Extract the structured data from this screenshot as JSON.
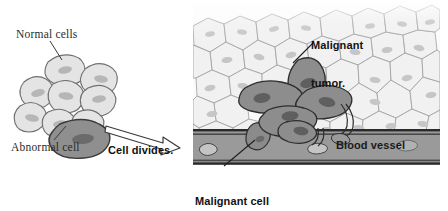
{
  "diagram": {
    "labels": {
      "normal_cells": "Normal cells",
      "abnormal_cell": "Abnormal cell",
      "cell_divides": "Cell divides.",
      "malignant_tumor_line1": "Malignant",
      "malignant_tumor_line2": "tumor.",
      "blood_vessel": "Blood vessel",
      "invades_line1": "Malignant cell",
      "invades_line2": "invades blood."
    },
    "colors": {
      "background": "#ffffff",
      "normal_cell_fill": "#e3e3e3",
      "normal_cell_stroke": "#6e6e6e",
      "normal_nucleus": "#b4b4b4",
      "abnormal_cell_fill": "#8e8e8e",
      "abnormal_cell_stroke": "#3a3a3a",
      "abnormal_nucleus": "#6a6a6a",
      "tissue_fill": "#f2f2f2",
      "tissue_stroke": "#9a9a9a",
      "tumor_fill": "#8d8d8d",
      "tumor_stroke": "#2e2e2e",
      "vessel_fill": "#9a9a9a",
      "vessel_wall": "#2a2a2a",
      "blood_cell_fill": "#c9c9c9",
      "arrow_fill": "#ffffff",
      "arrow_stroke": "#3a3a3a",
      "leader_line": "#3a3a3a",
      "text": "#2b2b2b"
    },
    "panels": {
      "left_panel_name": "normal-tissue-with-abnormal-cell",
      "right_panel_name": "malignant-tumor-invading-blood-vessel"
    },
    "icons": {
      "arrow": "right-arrow-icon",
      "leader_normal": "leader-line-icon",
      "leader_abnormal": "leader-line-icon",
      "leader_tumor": "leader-line-icon",
      "leader_invades": "leader-line-icon"
    }
  }
}
